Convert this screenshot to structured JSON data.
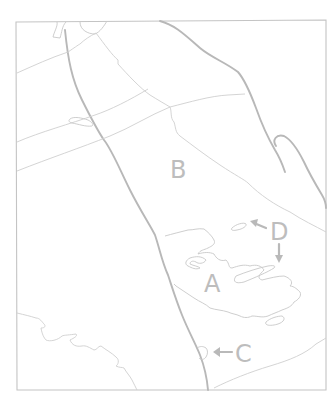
{
  "map": {
    "type": "hand-drawn sketch map",
    "colors": {
      "background": "#ffffff",
      "lines": "#c4c4c4",
      "labels": "#bdbdbd"
    },
    "labels": {
      "a": "A",
      "b": "B",
      "c": "C",
      "d": "D"
    },
    "annotations": [
      {
        "label": "A",
        "note": "large irregular region at lower center-right"
      },
      {
        "label": "B",
        "note": "region label in central upper area"
      },
      {
        "label": "C",
        "note": "arrow pointing left to small feature on thick boundary line"
      },
      {
        "label": "D",
        "note": "two arrows pointing to small elongated shapes"
      }
    ]
  }
}
